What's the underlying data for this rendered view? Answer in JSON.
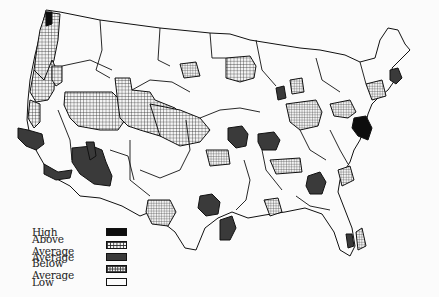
{
  "map": {
    "title": "",
    "subject": "United States choropleth by regional area",
    "legend": [
      {
        "label": "High",
        "category": "high",
        "fill": "solid-black"
      },
      {
        "label": "Above Average",
        "category": "above-average",
        "fill": "coarse-grid"
      },
      {
        "label": "Average",
        "category": "average",
        "fill": "solid-dark-gray"
      },
      {
        "label": "Below Average",
        "category": "below-average",
        "fill": "fine-grid"
      },
      {
        "label": "Low",
        "category": "low",
        "fill": "white"
      }
    ],
    "colors": {
      "high": "#0d0d0d",
      "average": "#3a3a3a",
      "grid_line": "#2a2a2a",
      "low": "#fbfbfb",
      "border": "#111111"
    },
    "regions": [
      {
        "name": "Seattle area",
        "category": "high"
      },
      {
        "name": "Western Washington",
        "category": "above-average"
      },
      {
        "name": "Western Oregon",
        "category": "above-average"
      },
      {
        "name": "Idaho-Boise area",
        "category": "above-average"
      },
      {
        "name": "Great Basin / Utah",
        "category": "above-average"
      },
      {
        "name": "Colorado-Kansas corridor",
        "category": "above-average"
      },
      {
        "name": "Northern California coast",
        "category": "above-average"
      },
      {
        "name": "Central Valley / Bay Area",
        "category": "average"
      },
      {
        "name": "Southern California",
        "category": "average"
      },
      {
        "name": "Arizona",
        "category": "average"
      },
      {
        "name": "Southern Nevada",
        "category": "average"
      },
      {
        "name": "Minnesota / Upper Midwest",
        "category": "above-average"
      },
      {
        "name": "Kansas City area",
        "category": "average"
      },
      {
        "name": "St. Louis area",
        "category": "average"
      },
      {
        "name": "Dallas-Fort Worth",
        "category": "average"
      },
      {
        "name": "Houston area",
        "category": "average"
      },
      {
        "name": "Atlanta area",
        "category": "average"
      },
      {
        "name": "South Florida",
        "category": "average"
      },
      {
        "name": "Boston area",
        "category": "average"
      },
      {
        "name": "Washington DC / Baltimore",
        "category": "high"
      },
      {
        "name": "Chicago area",
        "category": "average"
      },
      {
        "name": "Ohio Valley",
        "category": "below-average"
      },
      {
        "name": "Mid-Atlantic",
        "category": "below-average"
      },
      {
        "name": "Central Texas",
        "category": "below-average"
      },
      {
        "name": "Oklahoma",
        "category": "below-average"
      },
      {
        "name": "Tennessee",
        "category": "below-average"
      },
      {
        "name": "Louisiana",
        "category": "below-average"
      },
      {
        "name": "Carolinas coast",
        "category": "below-average"
      },
      {
        "name": "Southeast Florida coast",
        "category": "below-average"
      },
      {
        "name": "New England interior",
        "category": "below-average"
      },
      {
        "name": "Michigan",
        "category": "below-average"
      }
    ]
  }
}
